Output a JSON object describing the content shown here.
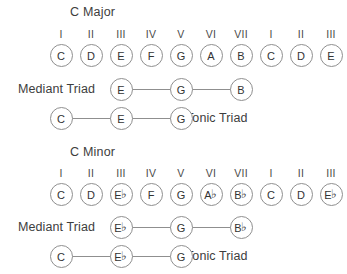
{
  "figure": {
    "geometry": {
      "first_center_x": 61,
      "column_spacing": 30
    },
    "sections": [
      {
        "id": "c-major",
        "title": "C Major",
        "title_x": 70,
        "title_y": 5,
        "degree_row_y": 28,
        "note_row_y": 44,
        "degrees": [
          "I",
          "II",
          "III",
          "IV",
          "V",
          "VI",
          "VII",
          "I",
          "II",
          "III"
        ],
        "scale": [
          {
            "letter": "C",
            "accidental": ""
          },
          {
            "letter": "D",
            "accidental": ""
          },
          {
            "letter": "E",
            "accidental": ""
          },
          {
            "letter": "F",
            "accidental": ""
          },
          {
            "letter": "G",
            "accidental": ""
          },
          {
            "letter": "A",
            "accidental": ""
          },
          {
            "letter": "B",
            "accidental": ""
          },
          {
            "letter": "C",
            "accidental": ""
          },
          {
            "letter": "D",
            "accidental": ""
          },
          {
            "letter": "E",
            "accidental": ""
          }
        ],
        "triads": [
          {
            "id": "mediant-triad-major",
            "name": "Mediant Triad",
            "label_side": "left",
            "label_x": 18,
            "row_y": 78,
            "columns": [
              2,
              4,
              6
            ],
            "notes": [
              {
                "letter": "E",
                "accidental": ""
              },
              {
                "letter": "G",
                "accidental": ""
              },
              {
                "letter": "B",
                "accidental": ""
              }
            ]
          },
          {
            "id": "tonic-triad-major",
            "name": "Tonic Triad",
            "label_side": "right",
            "label_x": 186,
            "row_y": 107,
            "columns": [
              0,
              2,
              4
            ],
            "notes": [
              {
                "letter": "C",
                "accidental": ""
              },
              {
                "letter": "E",
                "accidental": ""
              },
              {
                "letter": "G",
                "accidental": ""
              }
            ]
          }
        ]
      },
      {
        "id": "c-minor",
        "title": "C Minor",
        "title_x": 70,
        "title_y": 145,
        "degree_row_y": 167,
        "note_row_y": 183,
        "degrees": [
          "I",
          "II",
          "III",
          "IV",
          "V",
          "VI",
          "VII",
          "I",
          "II",
          "III"
        ],
        "scale": [
          {
            "letter": "C",
            "accidental": ""
          },
          {
            "letter": "D",
            "accidental": ""
          },
          {
            "letter": "E",
            "accidental": "♭"
          },
          {
            "letter": "F",
            "accidental": ""
          },
          {
            "letter": "G",
            "accidental": ""
          },
          {
            "letter": "A",
            "accidental": "♭"
          },
          {
            "letter": "B",
            "accidental": "♭"
          },
          {
            "letter": "C",
            "accidental": ""
          },
          {
            "letter": "D",
            "accidental": ""
          },
          {
            "letter": "E",
            "accidental": "♭"
          }
        ],
        "triads": [
          {
            "id": "mediant-triad-minor",
            "name": "Mediant Triad",
            "label_side": "left",
            "label_x": 18,
            "row_y": 216,
            "columns": [
              2,
              4,
              6
            ],
            "notes": [
              {
                "letter": "E",
                "accidental": "♭"
              },
              {
                "letter": "G",
                "accidental": ""
              },
              {
                "letter": "B",
                "accidental": "♭"
              }
            ]
          },
          {
            "id": "tonic-triad-minor",
            "name": "Tonic Triad",
            "label_side": "right",
            "label_x": 186,
            "row_y": 245,
            "columns": [
              0,
              2,
              4
            ],
            "notes": [
              {
                "letter": "C",
                "accidental": ""
              },
              {
                "letter": "E",
                "accidental": "♭"
              },
              {
                "letter": "G",
                "accidental": ""
              }
            ]
          }
        ]
      }
    ]
  }
}
